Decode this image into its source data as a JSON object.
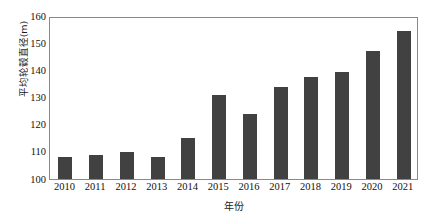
{
  "chart_data": {
    "type": "bar",
    "title": "",
    "subtitle": "",
    "xlabel": "年份",
    "ylabel": "平均轮毂直径(m)",
    "categories": [
      "2010",
      "2011",
      "2012",
      "2013",
      "2014",
      "2015",
      "2016",
      "2017",
      "2018",
      "2019",
      "2020",
      "2021"
    ],
    "values": [
      108,
      109,
      110,
      108,
      115,
      131,
      124,
      134,
      137.5,
      139.5,
      147,
      154.5
    ],
    "series": [
      {
        "name": "平均轮毂直径(m)",
        "values": [
          108,
          109,
          110,
          108,
          115,
          131,
          124,
          134,
          137.5,
          139.5,
          147,
          154.5
        ]
      }
    ],
    "ylim": [
      100,
      160
    ],
    "yticks": [
      100,
      110,
      120,
      130,
      140,
      150,
      160
    ],
    "ytick_labels": [
      "100",
      "110",
      "120",
      "130",
      "140",
      "150",
      "160"
    ],
    "xtick_labels": [
      "2010",
      "2011",
      "2012",
      "2013",
      "2014",
      "2015",
      "2016",
      "2017",
      "2018",
      "2019",
      "2020",
      "2021"
    ],
    "grid": false,
    "legend": false,
    "legend_position": "none",
    "bar_color": "#414141",
    "axis_color": "#8a8a8a",
    "background_color": "#ffffff"
  }
}
